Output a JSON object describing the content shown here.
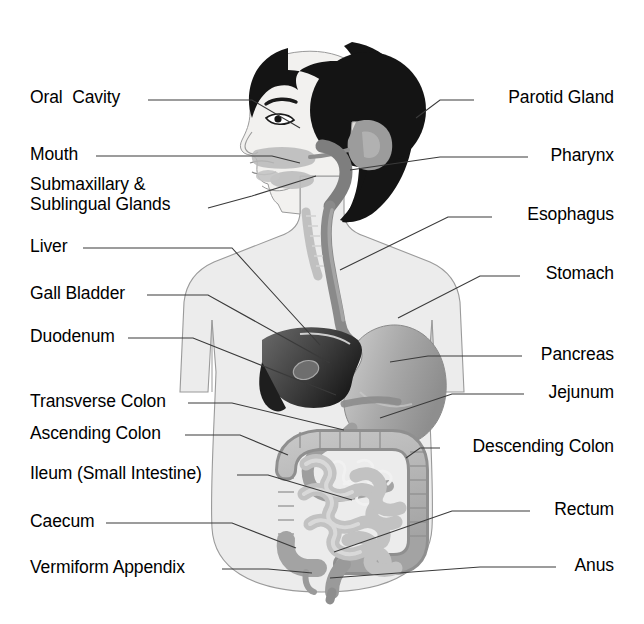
{
  "diagram": {
    "background_color": "#ffffff",
    "text_color": "#000000",
    "leader_line_color": "#3a3a3a",
    "palette": {
      "hair": "#141414",
      "skin": "#f2f1ef",
      "body_fill": "#ececec",
      "body_outline": "#9a9a9a",
      "liver": "#4a4a4a",
      "liver_dark": "#1e1e1e",
      "gall_bladder": "#6e6e6e",
      "stomach": "#a8a8a8",
      "esophagus": "#8a8a8a",
      "pharynx": "#7e7e7e",
      "parotid": "#9c9c9c",
      "colon": "#b4b4b4",
      "colon_edge": "#8f8f8f",
      "small_intestine": "#c2c2c2",
      "duodenum": "#9e9e9e"
    }
  },
  "labels_left": [
    {
      "id": "oral-cavity",
      "text": "Oral  Cavity",
      "x": 30,
      "y": 88,
      "line": [
        [
          148,
          100
        ],
        [
          252,
          100
        ],
        [
          300,
          128
        ]
      ]
    },
    {
      "id": "mouth",
      "text": "Mouth",
      "x": 30,
      "y": 145,
      "line": [
        [
          96,
          156
        ],
        [
          272,
          156
        ],
        [
          300,
          163
        ]
      ]
    },
    {
      "id": "salivary-glands",
      "text": "Submaxillary &\nSublingual Glands",
      "x": 30,
      "y": 175,
      "line": [
        [
          208,
          208
        ],
        [
          252,
          196
        ],
        [
          316,
          176
        ]
      ]
    },
    {
      "id": "liver",
      "text": "Liver",
      "x": 30,
      "y": 237,
      "line": [
        [
          83,
          248
        ],
        [
          232,
          248
        ],
        [
          320,
          345
        ]
      ]
    },
    {
      "id": "gall-bladder",
      "text": "Gall Bladder",
      "x": 30,
      "y": 284,
      "line": [
        [
          147,
          295
        ],
        [
          208,
          295
        ],
        [
          330,
          363
        ]
      ]
    },
    {
      "id": "duodenum",
      "text": "Duodenum",
      "x": 30,
      "y": 327,
      "line": [
        [
          128,
          338
        ],
        [
          193,
          338
        ],
        [
          336,
          395
        ]
      ]
    },
    {
      "id": "transverse-colon",
      "text": "Transverse Colon",
      "x": 30,
      "y": 392,
      "line": [
        [
          188,
          403
        ],
        [
          232,
          403
        ],
        [
          344,
          430
        ]
      ]
    },
    {
      "id": "ascending-colon",
      "text": "Ascending Colon",
      "x": 30,
      "y": 424,
      "line": [
        [
          185,
          435
        ],
        [
          240,
          435
        ],
        [
          288,
          455
        ]
      ]
    },
    {
      "id": "ileum",
      "text": "Ileum (Small Intestine)",
      "x": 30,
      "y": 464,
      "line": [
        [
          237,
          475
        ],
        [
          268,
          475
        ],
        [
          352,
          500
        ]
      ]
    },
    {
      "id": "caecum",
      "text": "Caecum",
      "x": 30,
      "y": 512,
      "line": [
        [
          106,
          523
        ],
        [
          232,
          523
        ],
        [
          296,
          548
        ]
      ]
    },
    {
      "id": "vermiform-appendix",
      "text": "Vermiform Appendix",
      "x": 30,
      "y": 558,
      "line": [
        [
          222,
          569
        ],
        [
          268,
          569
        ],
        [
          312,
          573
        ]
      ]
    }
  ],
  "labels_right": [
    {
      "id": "parotid-gland",
      "text": "Parotid Gland",
      "x": 614,
      "y": 88,
      "line": [
        [
          474,
          100
        ],
        [
          440,
          100
        ],
        [
          416,
          118
        ]
      ]
    },
    {
      "id": "pharynx",
      "text": "Pharynx",
      "x": 614,
      "y": 146,
      "line": [
        [
          528,
          157
        ],
        [
          440,
          157
        ],
        [
          350,
          170
        ]
      ]
    },
    {
      "id": "esophagus",
      "text": "Esophagus",
      "x": 614,
      "y": 205,
      "line": [
        [
          492,
          217
        ],
        [
          448,
          217
        ],
        [
          340,
          270
        ]
      ]
    },
    {
      "id": "stomach",
      "text": "Stomach",
      "x": 614,
      "y": 264,
      "line": [
        [
          520,
          276
        ],
        [
          480,
          276
        ],
        [
          398,
          318
        ]
      ]
    },
    {
      "id": "pancreas",
      "text": "Pancreas",
      "x": 614,
      "y": 345,
      "line": [
        [
          522,
          356
        ],
        [
          428,
          356
        ],
        [
          390,
          362
        ]
      ]
    },
    {
      "id": "jejunum",
      "text": "Jejunum",
      "x": 614,
      "y": 383,
      "line": [
        [
          524,
          394
        ],
        [
          452,
          394
        ],
        [
          380,
          418
        ]
      ]
    },
    {
      "id": "descending-colon",
      "text": "Descending Colon",
      "x": 614,
      "y": 437,
      "line": [
        [
          440,
          448
        ],
        [
          420,
          448
        ],
        [
          406,
          458
        ]
      ]
    },
    {
      "id": "rectum",
      "text": "Rectum",
      "x": 614,
      "y": 500,
      "line": [
        [
          530,
          511
        ],
        [
          452,
          511
        ],
        [
          334,
          552
        ]
      ]
    },
    {
      "id": "anus",
      "text": "Anus",
      "x": 614,
      "y": 556,
      "line": [
        [
          556,
          567
        ],
        [
          480,
          567
        ],
        [
          330,
          578
        ]
      ]
    }
  ]
}
